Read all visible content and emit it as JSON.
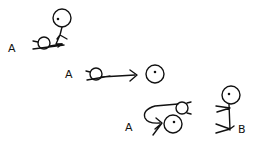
{
  "diagram": {
    "stroke_color": "#111111",
    "background": "#ffffff",
    "panels": [
      {
        "id": "panel-1",
        "description": "Figure A lying on ground, figure stands over it",
        "labels": [
          {
            "text": "A",
            "x": 8,
            "y": 43
          }
        ]
      },
      {
        "id": "panel-2",
        "description": "Figure A lying, arrow pointing to a head",
        "labels": [
          {
            "text": "A",
            "x": 65,
            "y": 69
          }
        ]
      },
      {
        "id": "panel-3",
        "description": "Figure A curled with looping arrow; figure B seated",
        "labels": [
          {
            "text": "A",
            "x": 125,
            "y": 122
          },
          {
            "text": "B",
            "x": 238,
            "y": 124
          }
        ]
      }
    ]
  }
}
